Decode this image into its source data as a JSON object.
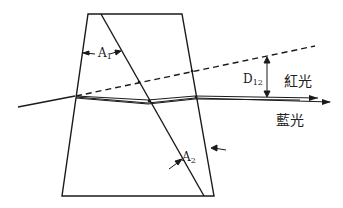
{
  "diagram": {
    "title": "",
    "labels": {
      "a1": {
        "main": "A",
        "sub": "1"
      },
      "a2": {
        "main": "A",
        "sub": "2"
      },
      "d12": {
        "main": "D",
        "sub": "12"
      },
      "red_light": "紅光",
      "blue_light": "藍光"
    },
    "colors": {
      "stroke": "#1a1a1a",
      "background": "#ffffff"
    }
  }
}
